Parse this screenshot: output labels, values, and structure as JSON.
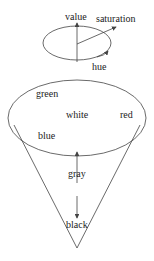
{
  "diagram": {
    "top_ellipse_labels": {
      "value": "value",
      "saturation": "saturation",
      "hue": "hue"
    },
    "cone_labels": {
      "green": "green",
      "white": "white",
      "red": "red",
      "blue": "blue",
      "gray": "gray",
      "black": "black"
    },
    "colors": {
      "stroke": "#444444",
      "text": "#222222",
      "background": "#ffffff"
    }
  }
}
